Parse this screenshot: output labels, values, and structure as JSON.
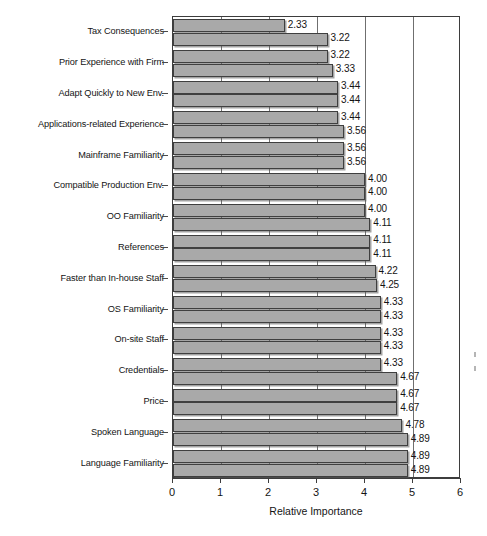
{
  "chart_data": {
    "type": "bar",
    "orientation": "horizontal",
    "title": "",
    "xlabel": "Relative Importance",
    "ylabel": "",
    "xlim": [
      0,
      6
    ],
    "xticks": [
      0,
      1,
      2,
      3,
      4,
      5,
      6
    ],
    "xtick_labels": [
      "0",
      "1",
      "2",
      "3",
      "4",
      "5",
      "6"
    ],
    "grid": true,
    "gridlines_x": [
      1,
      2,
      3,
      4,
      5
    ],
    "legend": "none",
    "bar_color": "#a9a9a9",
    "bar_edge_color": "#3f3f3f",
    "categories": [
      "Tax Consequences",
      "Prior Experience with Firm",
      "Adapt Quickly to New Env.",
      "Applications-related Experience",
      "Mainframe Familiarity",
      "Compatible Production Env.",
      "OO Familiarity",
      "References",
      "Faster than In-house Staff",
      "OS Familiarity",
      "On-site Staff",
      "Credentials",
      "Price",
      "Spoken Language",
      "Language Familiarity"
    ],
    "series": [
      {
        "name": "Series 1",
        "values": [
          2.33,
          3.22,
          3.44,
          3.44,
          3.56,
          4.0,
          4.0,
          4.11,
          4.22,
          4.33,
          4.33,
          4.33,
          4.67,
          4.78,
          4.89
        ]
      },
      {
        "name": "Series 2",
        "values": [
          3.22,
          3.33,
          3.44,
          3.56,
          3.56,
          4.0,
          4.11,
          4.11,
          4.25,
          4.33,
          4.33,
          4.67,
          4.67,
          4.89,
          4.89
        ]
      }
    ],
    "value_labels": [
      [
        "2.33",
        "3.22"
      ],
      [
        "3.22",
        "3.33"
      ],
      [
        "3.44",
        "3.44"
      ],
      [
        "3.44",
        "3.56"
      ],
      [
        "3.56",
        "3.56"
      ],
      [
        "4.00",
        "4.00"
      ],
      [
        "4.00",
        "4.11"
      ],
      [
        "4.11",
        "4.11"
      ],
      [
        "4.22",
        "4.25"
      ],
      [
        "4.33",
        "4.33"
      ],
      [
        "4.33",
        "4.33"
      ],
      [
        "4.33",
        "4.67"
      ],
      [
        "4.67",
        "4.67"
      ],
      [
        "4.78",
        "4.89"
      ],
      [
        "4.89",
        "4.89"
      ]
    ]
  }
}
